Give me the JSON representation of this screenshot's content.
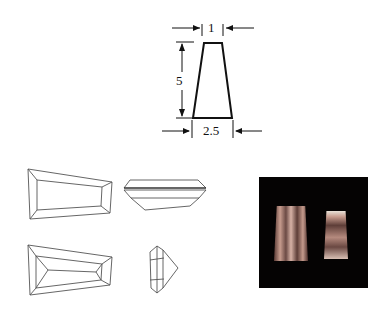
{
  "dimension_diagram": {
    "shape": "tapered-baguette",
    "top_width_label": "1",
    "height_label": "5",
    "bottom_width_label": "2.5"
  },
  "views": [
    {
      "name": "table-view-top",
      "description": "Top (crown) view"
    },
    {
      "name": "profile-view-side",
      "description": "Side profile view"
    },
    {
      "name": "pavilion-view-bottom",
      "description": "Bottom (pavilion) view"
    },
    {
      "name": "end-view",
      "description": "End view"
    }
  ],
  "photo": {
    "description": "Photograph of two tapered baguette-cut gemstones on black background",
    "background": "#050303",
    "gem_color": "#b88a80"
  },
  "colors": {
    "line": "#111111",
    "thin_line": "#555555",
    "background": "#ffffff"
  }
}
